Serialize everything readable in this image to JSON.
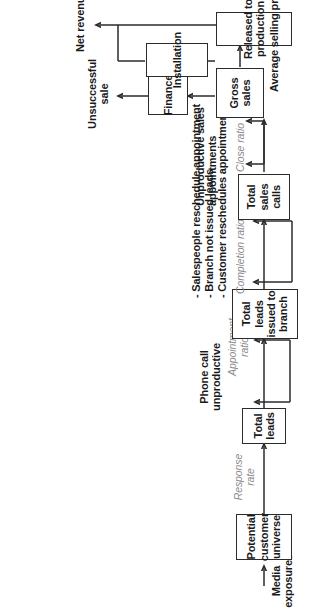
{
  "diagram": {
    "orientation": "rotated-90-ccw",
    "nodes": [
      {
        "id": "potential_customer_universe",
        "label": "Potential\ncustomer\nuniverse"
      },
      {
        "id": "total_leads",
        "label": "Total\nleads"
      },
      {
        "id": "total_leads_issued_to_branch",
        "label": "Total\nleads\nissued to\nbranch"
      },
      {
        "id": "total_sales_calls",
        "label": "Total\nsales\ncalls"
      },
      {
        "id": "gross_sales",
        "label": "Gross\nsales"
      },
      {
        "id": "finance",
        "label": "Finance"
      },
      {
        "id": "released_to_production",
        "label": "Released to\nproduction"
      },
      {
        "id": "installation",
        "label": "Installation"
      }
    ],
    "input_labels": [
      {
        "id": "media_exposures",
        "label": "Media\nexposures"
      }
    ],
    "loss_labels": [
      {
        "id": "phone_call_unproductive",
        "label": "Phone call\nunproductive"
      },
      {
        "id": "unproductive_sales_appointments",
        "label": "Unproductive sales\nappointments"
      },
      {
        "id": "unsuccessful_sale",
        "label": "Unsuccessful\nsale"
      }
    ],
    "output_labels": [
      {
        "id": "net_revenue",
        "label": "Net revenue"
      },
      {
        "id": "average_selling_price",
        "label": "Average selling price"
      }
    ],
    "ratios": [
      {
        "id": "response_rate",
        "label": "Response\nrate"
      },
      {
        "id": "appointment_ratio",
        "label": "Appointment\nratio"
      },
      {
        "id": "completion_ratio",
        "label": "Completion ratio"
      },
      {
        "id": "close_ratio",
        "label": "Close ratio"
      }
    ],
    "loss_reasons": {
      "id": "completion_loss_reasons",
      "label": "- Salespeople reschedule appointment\n- Branch not issued leads\n- Customer reschedules appointment"
    },
    "colors": {
      "stroke": "#2b2b2b",
      "text": "#1a1a1a",
      "ratio_text": "#8a8a8a",
      "background": "#ffffff"
    }
  }
}
